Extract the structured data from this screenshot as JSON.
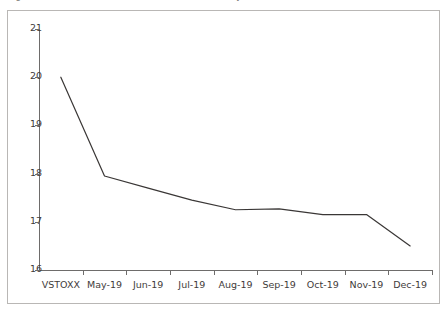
{
  "caption": {
    "text": "Figure 3: VSTOXX futures term structure (monthly maturities, 2019)"
  },
  "chart_data": {
    "type": "line",
    "title": "",
    "subtitle": "",
    "xlabel": "",
    "ylabel": "",
    "categories": [
      "VSTOXX",
      "May-19",
      "Jun-19",
      "Jul-19",
      "Aug-19",
      "Sep-19",
      "Oct-19",
      "Nov-19",
      "Dec-19"
    ],
    "series": [
      {
        "name": "VSTOXX futures term structure",
        "values": [
          20.0,
          17.95,
          17.7,
          17.45,
          17.25,
          17.27,
          17.15,
          17.15,
          16.5
        ],
        "color": "#3a3736",
        "line_width": 1.2,
        "markers": false
      }
    ],
    "ylim": [
      16,
      21
    ],
    "yticks": [
      16,
      17,
      18,
      19,
      20,
      21
    ],
    "ytick_labels": [
      "16",
      "17",
      "18",
      "19",
      "20",
      "21"
    ],
    "grid": false,
    "legend": "none",
    "axis_color": "#6e6c6b",
    "frame": true
  }
}
